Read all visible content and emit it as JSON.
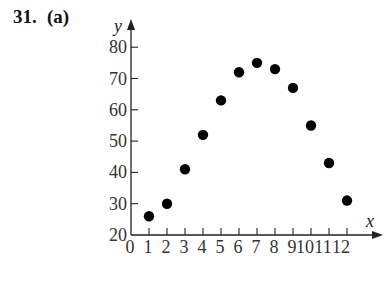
{
  "problem_label": "31.",
  "part_label": "(a)",
  "chart_data": {
    "type": "scatter",
    "title": "",
    "xlabel": "x",
    "ylabel": "y",
    "x": [
      1,
      2,
      3,
      4,
      5,
      6,
      7,
      8,
      9,
      10,
      11,
      12
    ],
    "y": [
      26,
      30,
      41,
      52,
      63,
      72,
      75,
      73,
      67,
      55,
      43,
      31
    ],
    "xlim": [
      0,
      12
    ],
    "ylim": [
      20,
      80
    ],
    "x_ticks": [
      "0",
      "1",
      "2",
      "3",
      "4",
      "5",
      "6",
      "7",
      "8",
      "9",
      "10",
      "11",
      "12"
    ],
    "y_ticks": [
      "20",
      "30",
      "40",
      "50",
      "60",
      "70",
      "80"
    ],
    "grid": false,
    "legend": null,
    "marker_color": "#000000"
  }
}
